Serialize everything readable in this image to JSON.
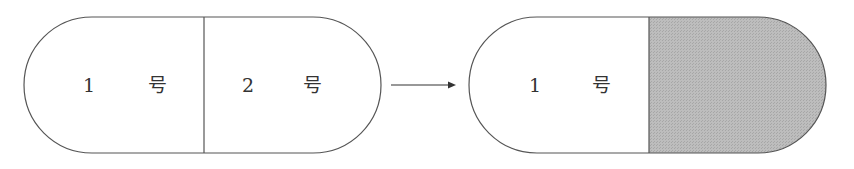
{
  "diagram": {
    "before": {
      "left_segment": {
        "number": "1",
        "unit": "号"
      },
      "right_segment": {
        "number": "2",
        "unit": "号"
      }
    },
    "after": {
      "left_segment": {
        "number": "1",
        "unit": "号"
      },
      "right_segment": {
        "fill": "shaded"
      }
    },
    "arrow": "→",
    "colors": {
      "stroke": "#555555",
      "shade": "#b4b4b4"
    }
  }
}
